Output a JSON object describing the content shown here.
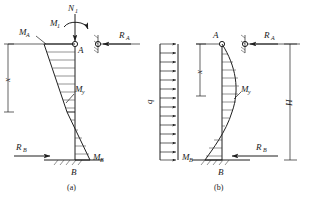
{
  "figure": {
    "type": "structural-engineering-diagram",
    "stroke_color": "#1f1f1f",
    "background_color": "#ffffff"
  },
  "panel_a": {
    "caption": "(a)",
    "labels": {
      "axial_load": "N",
      "axial_load_sub": "1",
      "applied_moment": "M",
      "applied_moment_sub": "1",
      "moment_at_a": "M",
      "moment_at_a_sub": "A",
      "reaction_a": "R",
      "reaction_a_sub": "A",
      "reaction_b": "R",
      "reaction_b_sub": "B",
      "moment_at_b": "M",
      "moment_at_b_sub": "B",
      "moment_diagram": "M",
      "moment_diagram_sub": "y",
      "node_a": "A",
      "node_b": "B",
      "dimension_x": "x"
    }
  },
  "panel_load": {
    "labels": {
      "distributed_load": "q"
    },
    "arrow_count": 13,
    "direction": "right"
  },
  "panel_b": {
    "caption": "(b)",
    "labels": {
      "node_a": "A",
      "node_b": "B",
      "reaction_a": "R",
      "reaction_a_sub": "A",
      "reaction_b": "R",
      "reaction_b_sub": "B",
      "moment_at_b": "M",
      "moment_at_b_sub": "B",
      "moment_diagram": "M",
      "moment_diagram_sub": "y",
      "dimension_x": "x",
      "dimension_h": "H"
    }
  }
}
